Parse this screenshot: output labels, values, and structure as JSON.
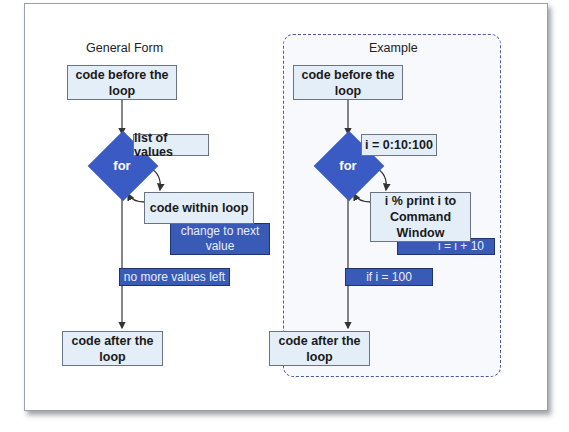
{
  "general_form": {
    "title": "General Form",
    "before": "code before the loop",
    "for_label": "for",
    "list_label": "list of values",
    "body": "code within loop",
    "change": "change to next value",
    "exit": "no more values left",
    "after": "code after the loop"
  },
  "example": {
    "title": "Example",
    "before": "code before the loop",
    "for_label": "for",
    "list_label": "i = 0:10:100",
    "body": "i  % print i to Command Window",
    "change": "i = i + 10",
    "exit": "if i = 100",
    "after": "code after the loop"
  },
  "colors": {
    "box_fill": "#e4eef8",
    "accent_blue": "#3a5bc4",
    "dashed_border": "#4a5a9a"
  }
}
